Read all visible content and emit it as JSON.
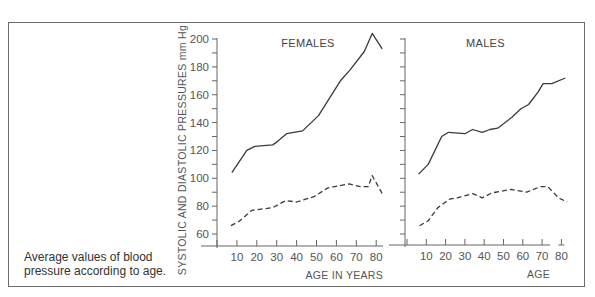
{
  "caption": {
    "line1": "Average values of blood",
    "line2": "pressure according to age."
  },
  "colors": {
    "frame": "#6b6b6b",
    "line": "#3a3a3a",
    "axis": "#666666"
  },
  "chart_data": [
    {
      "type": "line",
      "title": "FEMALES",
      "xlabel": "AGE IN YEARS",
      "ylabel": "SYSTOLIC AND DIASTOLIC PRESSURES mm Hg",
      "xlim": [
        0,
        85
      ],
      "ylim": [
        55,
        205
      ],
      "x_ticks": [
        10,
        20,
        30,
        40,
        50,
        60,
        70,
        80
      ],
      "y_ticks": [
        60,
        80,
        100,
        120,
        140,
        160,
        180,
        200
      ],
      "grid": false,
      "legend": null,
      "series": [
        {
          "name": "Systolic",
          "style": "solid",
          "x": [
            7.5,
            15,
            19,
            28,
            30,
            35,
            43,
            51,
            62,
            67,
            74,
            78,
            83
          ],
          "values": [
            104,
            120,
            123,
            124,
            126,
            132,
            134,
            145,
            170,
            178,
            191,
            204,
            193
          ]
        },
        {
          "name": "Diastolic",
          "style": "dashed",
          "x": [
            7,
            11,
            17.5,
            28,
            34.5,
            40,
            49,
            55.5,
            66.5,
            72,
            76,
            78,
            83
          ],
          "values": [
            66,
            69,
            77,
            79,
            84,
            83,
            87,
            93,
            96,
            94,
            94,
            102,
            89
          ]
        }
      ]
    },
    {
      "type": "line",
      "title": "MALES",
      "xlabel": "AGE",
      "ylabel": "",
      "xlim": [
        0,
        85
      ],
      "ylim": [
        55,
        205
      ],
      "x_ticks": [
        10,
        20,
        30,
        40,
        50,
        60,
        70,
        80
      ],
      "y_ticks": [
        60,
        80,
        100,
        120,
        140,
        160,
        180,
        200
      ],
      "grid": false,
      "legend": null,
      "series": [
        {
          "name": "Systolic",
          "style": "solid",
          "x": [
            6,
            11,
            18,
            21.5,
            30,
            34,
            39,
            43,
            47,
            54.5,
            59,
            63,
            68,
            70.5,
            75,
            82
          ],
          "values": [
            103,
            110,
            130,
            133,
            132,
            135,
            133,
            135,
            136,
            144,
            150,
            153,
            162,
            168,
            168,
            172
          ]
        },
        {
          "name": "Diastolic",
          "style": "dashed",
          "x": [
            6.5,
            11,
            16,
            22,
            26,
            34,
            39,
            44,
            54,
            62,
            69,
            73,
            78.5,
            83
          ],
          "values": [
            66,
            69.5,
            79,
            85,
            86,
            89,
            86,
            89.5,
            92,
            90,
            94,
            94,
            86,
            83
          ]
        }
      ]
    }
  ]
}
